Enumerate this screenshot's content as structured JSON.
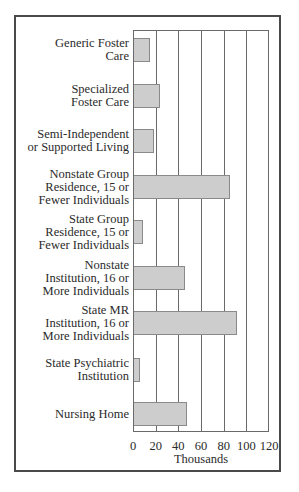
{
  "chart_data": {
    "type": "bar",
    "orientation": "horizontal",
    "title": "",
    "xlabel": "Thousands",
    "ylabel": "",
    "xlim": [
      0,
      120
    ],
    "xticks": [
      "0",
      "20",
      "40",
      "60",
      "80",
      "100",
      "120"
    ],
    "grid": true,
    "legend": null,
    "categories": [
      "Generic Foster Care",
      "Specialized Foster Care",
      "Semi-Independent or Supported Living",
      "Nonstate Group Residence, 15 or Fewer Individuals",
      "State Group Residence, 15 or Fewer Individuals",
      "Nonstate Institution, 16 or More Individuals",
      "State MR Institution, 16 or More Individuals",
      "State Psychiatric Institution",
      "Nursing Home"
    ],
    "values": [
      14,
      23,
      18,
      85,
      8,
      45,
      91,
      5,
      47
    ],
    "colors": {
      "bar_fill": "#cdcdcd",
      "bar_edge": "#8a8a8a",
      "grid": "#6a6a6a",
      "frame": "#4a4a4a"
    }
  },
  "labels": [
    [
      "Generic Foster",
      "Care"
    ],
    [
      "Specialized",
      "Foster Care"
    ],
    [
      "Semi-Independent",
      "or Supported Living"
    ],
    [
      "Nonstate Group",
      "Residence, 15 or",
      "Fewer Individuals"
    ],
    [
      "State Group",
      "Residence, 15 or",
      "Fewer Individuals"
    ],
    [
      "Nonstate",
      "Institution, 16 or",
      "More Individuals"
    ],
    [
      "State MR",
      "Institution, 16 or",
      "More Individuals"
    ],
    [
      "State Psychiatric",
      "Institution"
    ],
    [
      "Nursing Home"
    ]
  ],
  "axis": {
    "ticks": [
      "0",
      "20",
      "40",
      "60",
      "80",
      "100",
      "120"
    ],
    "xlabel": "Thousands"
  }
}
